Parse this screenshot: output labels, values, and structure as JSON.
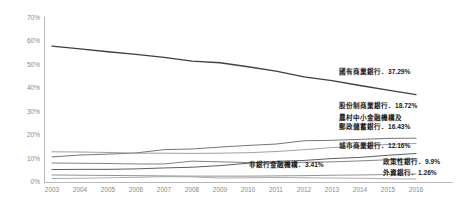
{
  "chart_data": {
    "type": "line",
    "title": "",
    "subtitle": "",
    "xlabel": "",
    "ylabel": "",
    "x": [
      2003,
      2004,
      2005,
      2006,
      2007,
      2008,
      2009,
      2010,
      2011,
      2012,
      2013,
      2014,
      2015,
      2016
    ],
    "categories": [
      "2003",
      "2004",
      "2005",
      "2006",
      "2007",
      "2008",
      "2009",
      "2010",
      "2011",
      "2012",
      "2013",
      "2014",
      "2015",
      "2016"
    ],
    "xtick_labels": [
      "2003",
      "2004",
      "2005",
      "2006",
      "2007",
      "2008",
      "2009",
      "2010",
      "2011",
      "2012",
      "2013",
      "2014",
      "2015",
      "2016"
    ],
    "ytick_labels": [
      "0%",
      "10%",
      "20%",
      "30%",
      "40%",
      "50%",
      "60%",
      "70%"
    ],
    "ytick_values": [
      0,
      10,
      20,
      30,
      40,
      50,
      60,
      70
    ],
    "ylim": [
      0,
      70
    ],
    "xlim": [
      2003,
      2016
    ],
    "grid": false,
    "legend_position": "inline-right-end-labels",
    "series": [
      {
        "name": "國有商業銀行",
        "end_label": "國有商業銀行．37.29%",
        "end_value": "37.29%",
        "color": "#3f3f3f",
        "values": [
          58.0,
          56.8,
          55.6,
          54.5,
          53.2,
          51.6,
          50.9,
          49.2,
          47.3,
          44.9,
          43.3,
          41.2,
          39.2,
          37.29
        ]
      },
      {
        "name": "股份制商業銀行",
        "end_label": "股份制商業銀行．18.72%",
        "end_value": "18.72%",
        "color": "#6e6e6e",
        "values": [
          10.7,
          11.5,
          11.9,
          12.4,
          13.8,
          14.1,
          14.9,
          15.6,
          16.2,
          17.6,
          17.8,
          18.2,
          18.6,
          18.72
        ]
      },
      {
        "name": "農村中小金融機構及郵政儲蓄銀行",
        "end_label": "農村中小金融機構及郵政儲蓄銀行．16.43%",
        "end_value": "16.43%",
        "color": "#9a9a9a",
        "values": [
          12.9,
          12.8,
          12.6,
          12.3,
          12.3,
          12.2,
          12.3,
          12.5,
          13.0,
          13.8,
          14.7,
          15.4,
          16.0,
          16.43
        ]
      },
      {
        "name": "城市商業銀行",
        "end_label": "城市商業銀行．12.16%",
        "end_value": "12.16%",
        "color": "#555555",
        "values": [
          5.3,
          5.4,
          5.4,
          5.6,
          6.0,
          6.3,
          7.0,
          8.0,
          8.8,
          9.2,
          10.0,
          10.5,
          11.4,
          12.16
        ]
      },
      {
        "name": "政策性銀行",
        "end_label": "政策性銀行．9.9%",
        "end_value": "9.9%",
        "color": "#7c7c7c",
        "values": [
          8.1,
          8.0,
          7.9,
          7.7,
          7.7,
          8.9,
          8.6,
          8.3,
          8.2,
          8.4,
          8.6,
          9.0,
          9.5,
          9.9
        ]
      },
      {
        "name": "非銀行金融機構",
        "end_label": "非銀行金融機構．3.41%",
        "end_value": "3.41%",
        "color": "#8c8c8c",
        "values": [
          3.0,
          2.9,
          2.8,
          2.7,
          2.6,
          2.5,
          2.5,
          2.5,
          2.6,
          2.7,
          2.9,
          3.0,
          3.2,
          3.41
        ]
      },
      {
        "name": "外資銀行",
        "end_label": "外資銀行．1.26%",
        "end_value": "1.26%",
        "color": "#a5a5a5",
        "values": [
          1.5,
          1.6,
          1.8,
          2.0,
          2.3,
          2.2,
          1.7,
          1.8,
          1.9,
          1.8,
          1.7,
          1.6,
          1.4,
          1.26
        ]
      }
    ],
    "annotations": [
      {
        "id": "a1",
        "text": "國有商業銀行．37.29%"
      },
      {
        "id": "a2",
        "text": "股份制商業銀行．18.72%"
      },
      {
        "id": "a3",
        "text": "農村中小金融機構及"
      },
      {
        "id": "a4",
        "text": "郵政儲蓄銀行．16.43%"
      },
      {
        "id": "a5",
        "text": "城市商業銀行．12.16%"
      },
      {
        "id": "a6",
        "text": "政策性銀行．9.9%"
      },
      {
        "id": "a7",
        "text": "外資銀行．1.26%"
      },
      {
        "id": "a8",
        "text": "非銀行金融機構．3.41%"
      }
    ]
  },
  "axis": {
    "y": [
      "70%",
      "60%",
      "50%",
      "40%",
      "30%",
      "20%",
      "10%",
      "0%"
    ],
    "x": [
      "2003",
      "2004",
      "2005",
      "2006",
      "2007",
      "2008",
      "2009",
      "2010",
      "2011",
      "2012",
      "2013",
      "2014",
      "2015",
      "2016"
    ]
  }
}
